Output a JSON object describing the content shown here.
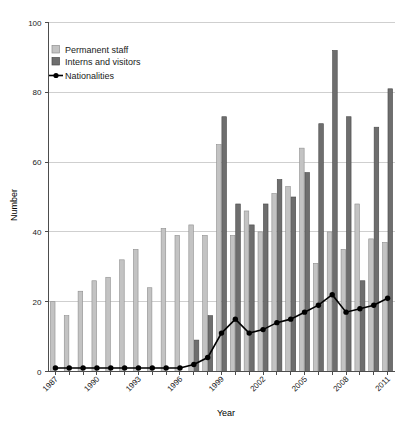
{
  "chart_data": {
    "type": "bar",
    "title": "",
    "xlabel": "Year",
    "ylabel": "Number",
    "ylim": [
      0,
      100
    ],
    "yticks": [
      0,
      20,
      40,
      60,
      80,
      100
    ],
    "grid": true,
    "legend_position": "top-left",
    "categories": [
      "1987",
      "1988",
      "1989",
      "1990",
      "1991",
      "1992",
      "1993",
      "1994",
      "1995",
      "1996",
      "1997",
      "1998",
      "1999",
      "2000",
      "2001",
      "2002",
      "2003",
      "2004",
      "2005",
      "2006",
      "2007",
      "2008",
      "2009",
      "2010",
      "2011"
    ],
    "xtick_labels_shown": [
      "1987",
      "1990",
      "1993",
      "1996",
      "1999",
      "2002",
      "2005",
      "2008",
      "2011"
    ],
    "series": [
      {
        "name": "Permanent staff",
        "type": "bar",
        "color": "#c3c3c3",
        "values": [
          20,
          16,
          23,
          26,
          27,
          32,
          35,
          24,
          41,
          39,
          42,
          39,
          65,
          39,
          46,
          40,
          51,
          53,
          64,
          31,
          40,
          35,
          48,
          38,
          37
        ]
      },
      {
        "name": "Interns and visitors",
        "type": "bar",
        "color": "#6e6e6e",
        "values": [
          0,
          0,
          0,
          0,
          0,
          0,
          0,
          0,
          0,
          0,
          9,
          16,
          73,
          48,
          42,
          48,
          55,
          50,
          57,
          71,
          92,
          73,
          26,
          70,
          81
        ]
      },
      {
        "name": "Nationalities",
        "type": "line",
        "color": "#000000",
        "values": [
          1,
          1,
          1,
          1,
          1,
          1,
          1,
          1,
          1,
          1,
          2,
          4,
          11,
          15,
          11,
          12,
          14,
          15,
          17,
          19,
          22,
          17,
          18,
          19,
          21
        ]
      }
    ]
  },
  "legend": {
    "items": [
      {
        "label": "Permanent staff",
        "marker": "square-light"
      },
      {
        "label": "Interns and visitors",
        "marker": "square-dark"
      },
      {
        "label": "Nationalities",
        "marker": "line-dot"
      }
    ]
  },
  "axes": {
    "y_title": "Number",
    "x_title": "Year"
  }
}
